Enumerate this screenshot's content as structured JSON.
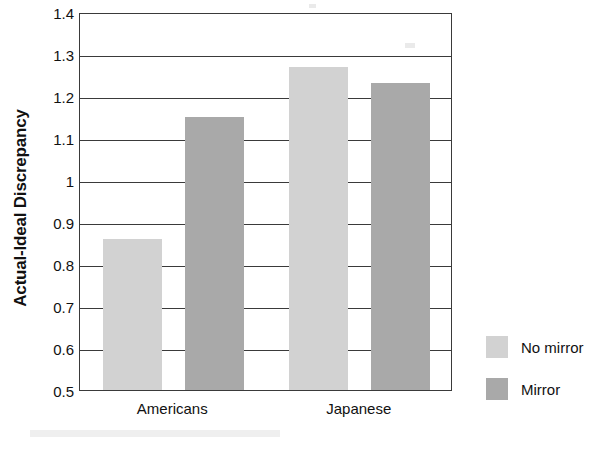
{
  "chart_data": {
    "type": "bar",
    "title": "",
    "subtitle": "",
    "xlabel": "",
    "ylabel": "Actual-Ideal Discrepancy",
    "categories": [
      "Americans",
      "Japanese"
    ],
    "series": [
      {
        "name": "No mirror",
        "values": [
          0.86,
          1.27
        ],
        "color": "#d2d2d2"
      },
      {
        "name": "Mirror",
        "values": [
          1.15,
          1.23
        ],
        "color": "#a9a9a9"
      }
    ],
    "ylim": [
      0.5,
      1.4
    ],
    "ytick_step": 0.1,
    "ytick_labels": [
      "1.4",
      "1.3",
      "1.2",
      "1.1",
      "1",
      "0.9",
      "0.8",
      "0.7",
      "0.6",
      "0.5"
    ],
    "ytick_values": [
      1.4,
      1.3,
      1.2,
      1.1,
      1.0,
      0.9,
      0.8,
      0.7,
      0.6,
      0.5
    ],
    "grid": true,
    "grid_axis": "y",
    "legend_position": "right",
    "legend_entries": [
      "No mirror",
      "Mirror"
    ],
    "bar_colors": {
      "no_mirror": "#d2d2d2",
      "mirror": "#a9a9a9"
    },
    "axis_color": "#3a3a3a",
    "background_color": "#ffffff"
  },
  "axis": {
    "y_title": "Actual-Ideal Discrepancy",
    "ticks": [
      {
        "label": "1.4",
        "value": 1.4
      },
      {
        "label": "1.3",
        "value": 1.3
      },
      {
        "label": "1.2",
        "value": 1.2
      },
      {
        "label": "1.1",
        "value": 1.1
      },
      {
        "label": "1",
        "value": 1.0
      },
      {
        "label": "0.9",
        "value": 0.9
      },
      {
        "label": "0.8",
        "value": 0.8
      },
      {
        "label": "0.7",
        "value": 0.7
      },
      {
        "label": "0.6",
        "value": 0.6
      },
      {
        "label": "0.5",
        "value": 0.5
      }
    ],
    "categories": [
      {
        "label": "Americans"
      },
      {
        "label": "Japanese"
      }
    ]
  },
  "bars": [
    {
      "group": "Americans",
      "series": "No mirror",
      "value": 0.86,
      "color": "#d2d2d2"
    },
    {
      "group": "Americans",
      "series": "Mirror",
      "value": 1.15,
      "color": "#a9a9a9"
    },
    {
      "group": "Japanese",
      "series": "No mirror",
      "value": 1.27,
      "color": "#d2d2d2"
    },
    {
      "group": "Japanese",
      "series": "Mirror",
      "value": 1.23,
      "color": "#a9a9a9"
    }
  ],
  "legend": {
    "items": [
      {
        "label": "No mirror",
        "color": "#d2d2d2"
      },
      {
        "label": "Mirror",
        "color": "#a9a9a9"
      }
    ]
  }
}
